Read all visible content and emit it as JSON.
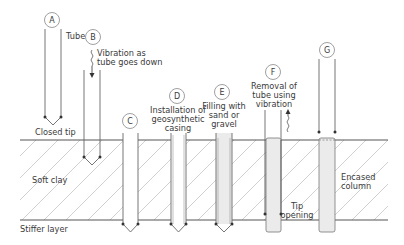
{
  "diagram": {
    "layers": {
      "soft_clay": "Soft clay",
      "stiffer_layer": "Stiffer layer"
    },
    "steps": [
      {
        "id": "A",
        "label": "A",
        "annotations": [
          "Tube",
          "Closed tip"
        ]
      },
      {
        "id": "B",
        "label": "B",
        "annotations": [
          "Vibration as",
          "tube goes down"
        ]
      },
      {
        "id": "C",
        "label": "C",
        "annotations": []
      },
      {
        "id": "D",
        "label": "D",
        "annotations": [
          "Installation of",
          "geosynthetic",
          "casing"
        ]
      },
      {
        "id": "E",
        "label": "E",
        "annotations": [
          "Filling with",
          "sand or",
          "gravel"
        ]
      },
      {
        "id": "F",
        "label": "F",
        "annotations": [
          "Removal of",
          "tube using",
          "vibration",
          "Tip",
          "opening"
        ]
      },
      {
        "id": "G",
        "label": "G",
        "annotations": [
          "Encased",
          "column"
        ]
      }
    ],
    "colors": {
      "line": "#555555",
      "hatch": "#bbbbbb",
      "fill": "#e8e8e8",
      "text": "#3a3a3a"
    }
  }
}
